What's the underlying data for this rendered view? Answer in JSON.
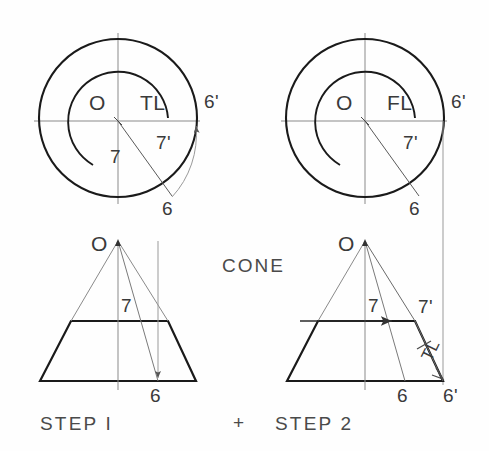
{
  "drawing": {
    "title": "CONE",
    "stroke_heavy": "#1a1a1a",
    "stroke_light": "#7d7d7d",
    "stroke_medium": "#4d4d4d",
    "background": "#fefefe"
  },
  "views": {
    "top_left": {
      "name": "Top view - Step 1",
      "center_label": "O",
      "arc_label": "TL",
      "radius_label": "7",
      "rotated_radius_label": "7'",
      "element_label": "6",
      "revolved_label": "6'"
    },
    "top_right": {
      "name": "Top view - Step 2",
      "center_label": "O",
      "arc_label": "FL",
      "rotated_radius_label": "7'",
      "element_label": "6",
      "revolved_label": "6'"
    },
    "bottom_left": {
      "name": "Front view - Step 1",
      "apex_label": "O",
      "axis_label": "7",
      "element_label": "6",
      "step_label": "STEP I"
    },
    "bottom_right": {
      "name": "Front view - Step 2",
      "apex_label": "O",
      "axis_label": "7",
      "true_length_label": "7'",
      "slant_tl_label": "TL",
      "element_label": "6",
      "revolved_label": "6'",
      "step_label": "STEP 2"
    }
  },
  "center_mark": {
    "symbol": "+"
  }
}
